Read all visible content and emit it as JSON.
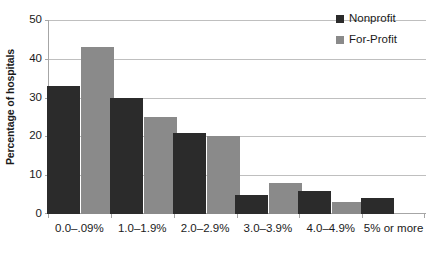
{
  "chart_data": {
    "type": "bar",
    "title": "",
    "subtitle": "",
    "xlabel": "",
    "ylabel": "Percentage of hospitals",
    "ylim": [
      0,
      50
    ],
    "yticks": [
      0,
      10,
      20,
      30,
      40,
      50
    ],
    "ytick_labels": [
      "0",
      "10",
      "20",
      "30",
      "40",
      "50"
    ],
    "grid": "horizontal",
    "legend_position": "top-right",
    "categories": [
      "0.0–.09%",
      "1.0–1.9%",
      "2.0–2.9%",
      "3.0–3.9%",
      "4.0–4.9%",
      "5% or more"
    ],
    "series": [
      {
        "name": "Nonprofit",
        "color": "#2b2b2b",
        "values": [
          33,
          30,
          21,
          5,
          6,
          4
        ]
      },
      {
        "name": "For-Profit",
        "color": "#8a8a8a",
        "values": [
          43,
          25,
          20,
          8,
          3,
          0
        ]
      }
    ],
    "annotations": []
  },
  "legend": {
    "items": [
      {
        "label": "Nonprofit",
        "color": "#2b2b2b",
        "swatch_icon": "square-swatch-icon"
      },
      {
        "label": "For-Profit",
        "color": "#8a8a8a",
        "swatch_icon": "square-swatch-icon"
      }
    ]
  },
  "colors": {
    "nonprofit": "#2b2b2b",
    "for_profit": "#8a8a8a",
    "gridline": "#bfbfbf",
    "axis": "#a6a6a6",
    "text": "#1a1a1a",
    "background": "#ffffff"
  }
}
